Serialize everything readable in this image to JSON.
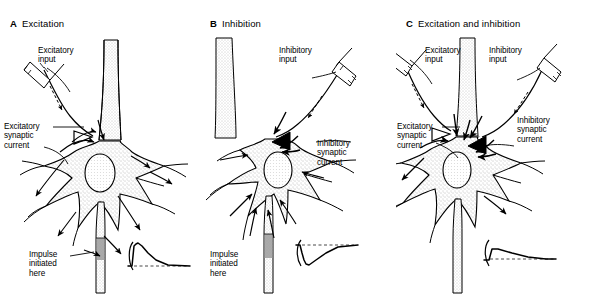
{
  "figure": {
    "style": "black-and-white line drawing, stippled shading",
    "panel_count": 3
  },
  "panels": [
    {
      "letter": "A",
      "title": "Excitation",
      "labels": {
        "input": "Excitatory\ninput",
        "current": "Excitatory\nsynaptic\ncurrent",
        "impulse": "Impulse\ninitiated\nhere"
      },
      "terminal_type": "open-triangle",
      "trace": {
        "name": "epsp",
        "description": "fast depolarizing rise above baseline then slow decay back to baseline",
        "direction": "upward",
        "points": "0,26 4,26 6,6 8,4 10,3 14,6 20,13 28,20 40,25 62,26",
        "baseline_y": 26
      }
    },
    {
      "letter": "B",
      "title": "Inhibition",
      "labels": {
        "input": "Inhibitory\ninput",
        "current": "Inhibitory\nsynaptic\ncurrent",
        "impulse": "Impulse\ninitiated\nhere"
      },
      "terminal_type": "filled-triangle",
      "trace": {
        "name": "ipsp",
        "description": "fast hyperpolarizing downward deflection then slow recovery to baseline",
        "direction": "downward",
        "points": "0,5 4,5 6,13 8,20 10,24 13,25 20,20 30,13 42,7 62,5",
        "baseline_y": 5
      }
    },
    {
      "letter": "C",
      "title": "Excitation and inhibition",
      "labels": {
        "input_excitatory": "Excitatory\ninput",
        "input_inhibitory": "Inhibitory\ninput",
        "current_excitatory": "Excitatory\nsynaptic\ncurrent",
        "current_inhibitory": "Inhibitory\nsynaptic\ncurrent"
      },
      "terminal_type": "open-and-filled-triangle",
      "trace": {
        "name": "net-subthreshold",
        "description": "small shallow depolarization that does not reach threshold, slowly returning to baseline",
        "direction": "upward-small",
        "points": "0,22 5,22 8,11 14,11 28,15 44,19 62,21 72,21",
        "baseline_y": 21
      }
    }
  ],
  "colors": {
    "ink": "#000000",
    "background": "#ffffff",
    "stipple": "#8a8a8a",
    "dashed_baseline": "#444444"
  }
}
